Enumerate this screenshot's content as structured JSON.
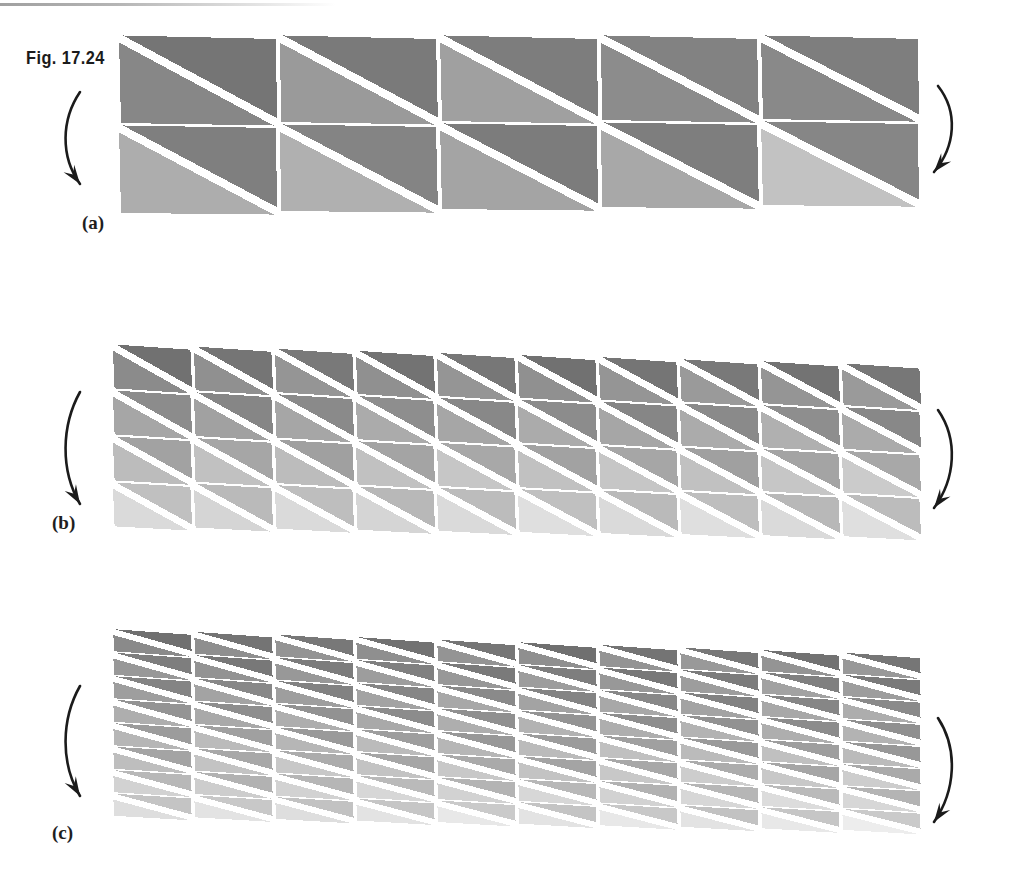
{
  "figure": {
    "number_label": "Fig. 17.24",
    "caption_labels": {
      "a": "(a)",
      "b": "(b)",
      "c": "(c)"
    }
  },
  "colors": {
    "background": "#ffffff",
    "gap": "#ffffff",
    "ink": "#1b1b1b",
    "dark_gray": "#767676",
    "mid_gray": "#949494",
    "light_gray": "#b6b6b6",
    "lightest_gray": "#cfcfcf",
    "scan_artifact": "#8f8f8f"
  },
  "icons": {
    "left_arrow": "curved-arrow-down-icon",
    "right_arrow": "curved-arrow-down-icon"
  },
  "chart_data": {
    "type": "diagram",
    "title": "Fig. 17.24",
    "panels": [
      {
        "id": "a",
        "label": "(a)",
        "columns": 5,
        "rows": 2,
        "triangles_per_cell": 2,
        "total_triangles": 20,
        "diagonal": "top-left-to-bottom-right",
        "origin": [
          118,
          36
        ],
        "cell_width": 160.5,
        "cell_height": 90,
        "shear_per_column": 0.0,
        "row_drop": 0.0,
        "shade_rows": [
          [
            "#7b7b7b",
            "#8d8d8d"
          ],
          [
            "#9d9d9d",
            "#b4b4b4"
          ]
        ],
        "cell_shades": [
          [
            [
              "#757575",
              "#878787"
            ],
            [
              "#7a7a7a",
              "#9a9a9a"
            ],
            [
              "#7d7d7d",
              "#a0a0a0"
            ],
            [
              "#828282",
              "#8c8c8c"
            ],
            [
              "#7e7e7e",
              "#898989"
            ]
          ],
          [
            [
              "#7f7f7f",
              "#adadad"
            ],
            [
              "#848484",
              "#b0b0b0"
            ],
            [
              "#7c7c7c",
              "#a4a4a4"
            ],
            [
              "#7e7e7e",
              "#a8a8a8"
            ],
            [
              "#868686",
              "#c2c2c2"
            ]
          ]
        ]
      },
      {
        "id": "b",
        "label": "(b)",
        "columns": 10,
        "rows": 4,
        "triangles_per_cell": 2,
        "total_triangles": 80,
        "diagonal": "top-left-to-bottom-right",
        "origin": [
          112,
          345
        ],
        "cell_width": 81,
        "cell_height": 46,
        "shear_per_column": 2.1,
        "row_drop": 0.0,
        "row_base_shades": [
          "#757575",
          "#8a8a8a",
          "#a4a4a4",
          "#bcbcbc"
        ]
      },
      {
        "id": "c",
        "label": "(c)",
        "columns": 10,
        "rows": 8,
        "triangles_per_cell": 2,
        "total_triangles": 160,
        "diagonal": "top-left-to-bottom-right",
        "origin": [
          112,
          630
        ],
        "cell_width": 81,
        "cell_height": 23.5,
        "shear_per_column": 2.6,
        "row_drop": 0.0,
        "row_base_shades": [
          "#747474",
          "#7c7c7c",
          "#868686",
          "#909090",
          "#9c9c9c",
          "#a8a8a8",
          "#b6b6b6",
          "#c6c6c6"
        ]
      }
    ],
    "arrows": [
      {
        "panel": "a",
        "side": "left",
        "x": 80,
        "y": 92,
        "height": 92,
        "direction": "down"
      },
      {
        "panel": "a",
        "side": "right",
        "x": 938,
        "y": 86,
        "height": 86,
        "direction": "down"
      },
      {
        "panel": "b",
        "side": "left",
        "x": 80,
        "y": 392,
        "height": 112,
        "direction": "down"
      },
      {
        "panel": "b",
        "side": "right",
        "x": 938,
        "y": 410,
        "height": 98,
        "direction": "down"
      },
      {
        "panel": "c",
        "side": "left",
        "x": 80,
        "y": 686,
        "height": 110,
        "direction": "down"
      },
      {
        "panel": "c",
        "side": "right",
        "x": 938,
        "y": 718,
        "height": 104,
        "direction": "down"
      }
    ]
  }
}
